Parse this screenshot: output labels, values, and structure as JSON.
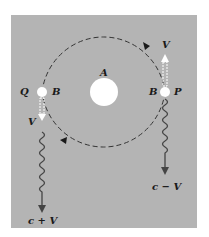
{
  "diagram": {
    "colors": {
      "panel": "#b4b4b4",
      "ink": "#1a1a1a",
      "body": "#ffffff",
      "wave": "#444444"
    },
    "labels": {
      "central_body": "A",
      "left_point": "Q",
      "left_body": "B",
      "right_body": "B",
      "right_point": "P",
      "velocity_left": "V",
      "velocity_right": "V",
      "light_left": "c + V",
      "light_right": "c − V"
    },
    "orbit": {
      "center": [
        104,
        92
      ],
      "radius": 62,
      "style": "dashed",
      "direction": "clockwise"
    }
  }
}
